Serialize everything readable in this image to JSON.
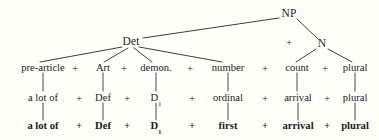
{
  "figure": {
    "type": "syntactic-tree-diagram",
    "background_color": "#fffffa",
    "ink_color": "#1a1a1a"
  },
  "tree": {
    "root": {
      "label": "NP",
      "x": 289,
      "y": 14
    },
    "plus_root": {
      "label": "+",
      "x": 289,
      "y": 42
    },
    "children": [
      {
        "label": "Det",
        "x": 131,
        "y": 42
      },
      {
        "label": "N",
        "x": 322,
        "y": 44
      }
    ]
  },
  "rows": [
    {
      "name": "category-row",
      "y": 68,
      "bold": false,
      "cells": [
        {
          "text": "pre-article",
          "x": 43
        },
        {
          "text": "+",
          "x": 75
        },
        {
          "text": "Art",
          "x": 103
        },
        {
          "text": "+",
          "x": 124
        },
        {
          "text": "demon.",
          "x": 156
        },
        {
          "text": "+",
          "x": 190
        },
        {
          "text": "number",
          "x": 228
        },
        {
          "text": "+",
          "x": 265
        },
        {
          "text": "count",
          "x": 297
        },
        {
          "text": "+",
          "x": 325
        },
        {
          "text": "plural",
          "x": 355
        }
      ]
    },
    {
      "name": "intermediate-row",
      "y": 98,
      "bold": false,
      "cells": [
        {
          "text": "a lot of",
          "x": 43
        },
        {
          "text": "+",
          "x": 79
        },
        {
          "text": "Def",
          "x": 103
        },
        {
          "text": "+",
          "x": 127
        },
        {
          "text": "D",
          "x": 156,
          "sub": "1"
        },
        {
          "text": "+",
          "x": 192
        },
        {
          "text": "ordinal",
          "x": 228
        },
        {
          "text": "+",
          "x": 265
        },
        {
          "text": "arrival",
          "x": 298
        },
        {
          "text": "+",
          "x": 327
        },
        {
          "text": "plural",
          "x": 355
        }
      ]
    },
    {
      "name": "surface-row",
      "y": 126,
      "bold": true,
      "cells": [
        {
          "text": "a lot of",
          "x": 43
        },
        {
          "text": "+",
          "x": 79
        },
        {
          "text": "Def",
          "x": 103
        },
        {
          "text": "+",
          "x": 127
        },
        {
          "text": "D",
          "x": 156,
          "sub": "1"
        },
        {
          "text": "+",
          "x": 192
        },
        {
          "text": "first",
          "x": 228
        },
        {
          "text": "+",
          "x": 265
        },
        {
          "text": "arrival",
          "x": 298
        },
        {
          "text": "+",
          "x": 327
        },
        {
          "text": "plural",
          "x": 355
        }
      ]
    }
  ],
  "edges": {
    "branches": [
      {
        "name": "np-to-det",
        "x1": 279,
        "y1": 18,
        "x2": 143,
        "y2": 38
      },
      {
        "name": "np-to-n",
        "x1": 297,
        "y1": 19,
        "x2": 318,
        "y2": 39
      },
      {
        "name": "det-to-pre-article",
        "x1": 122,
        "y1": 47,
        "x2": 40,
        "y2": 62
      },
      {
        "name": "det-to-art",
        "x1": 128,
        "y1": 48,
        "x2": 104,
        "y2": 62
      },
      {
        "name": "det-to-demon",
        "x1": 134,
        "y1": 48,
        "x2": 152,
        "y2": 62
      },
      {
        "name": "det-to-number",
        "x1": 139,
        "y1": 47,
        "x2": 222,
        "y2": 62
      },
      {
        "name": "n-to-count",
        "x1": 316,
        "y1": 49,
        "x2": 296,
        "y2": 62
      },
      {
        "name": "n-to-plural",
        "x1": 328,
        "y1": 49,
        "x2": 352,
        "y2": 62
      }
    ],
    "connectors": [
      {
        "name": "conn-pre-article",
        "x": 43,
        "y1": 73,
        "y2": 91
      },
      {
        "name": "conn-art",
        "x": 103,
        "y1": 73,
        "y2": 91
      },
      {
        "name": "conn-demon",
        "x": 156,
        "y1": 73,
        "y2": 91
      },
      {
        "name": "conn-number",
        "x": 228,
        "y1": 73,
        "y2": 91
      },
      {
        "name": "conn-count",
        "x": 297,
        "y1": 73,
        "y2": 91
      },
      {
        "name": "conn-plural",
        "x": 355,
        "y1": 73,
        "y2": 91
      },
      {
        "name": "conn2-a-lot-of",
        "x": 43,
        "y1": 103,
        "y2": 120
      },
      {
        "name": "conn2-def",
        "x": 103,
        "y1": 103,
        "y2": 120
      },
      {
        "name": "conn2-d1",
        "x": 156,
        "y1": 103,
        "y2": 120
      },
      {
        "name": "conn2-ordinal",
        "x": 228,
        "y1": 103,
        "y2": 120
      },
      {
        "name": "conn2-arrival",
        "x": 298,
        "y1": 103,
        "y2": 120
      },
      {
        "name": "conn2-plural",
        "x": 355,
        "y1": 103,
        "y2": 120
      }
    ]
  }
}
